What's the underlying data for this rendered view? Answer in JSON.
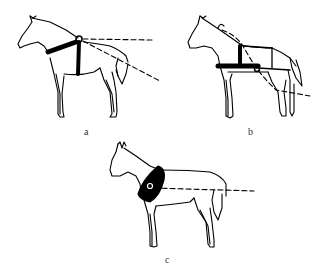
{
  "figure": {
    "type": "line-drawing",
    "colors": {
      "ink": "#000000",
      "background": "#ffffff",
      "label": "#333333"
    },
    "panels": [
      {
        "id": "a",
        "label": "a",
        "harness": "breast strap with vertical girth strap and pivot ring at withers",
        "lines": [
          "horizontal dashed",
          "diagonal dashed downward"
        ]
      },
      {
        "id": "b",
        "label": "b",
        "harness": "breast band with girth strap, back strap and breeching; ring at side",
        "lines": [
          "dashed curve from neck crest to ring then downward"
        ]
      },
      {
        "id": "c",
        "label": "c",
        "harness": "collar around neck with ring",
        "lines": [
          "horizontal dashed"
        ]
      }
    ]
  }
}
